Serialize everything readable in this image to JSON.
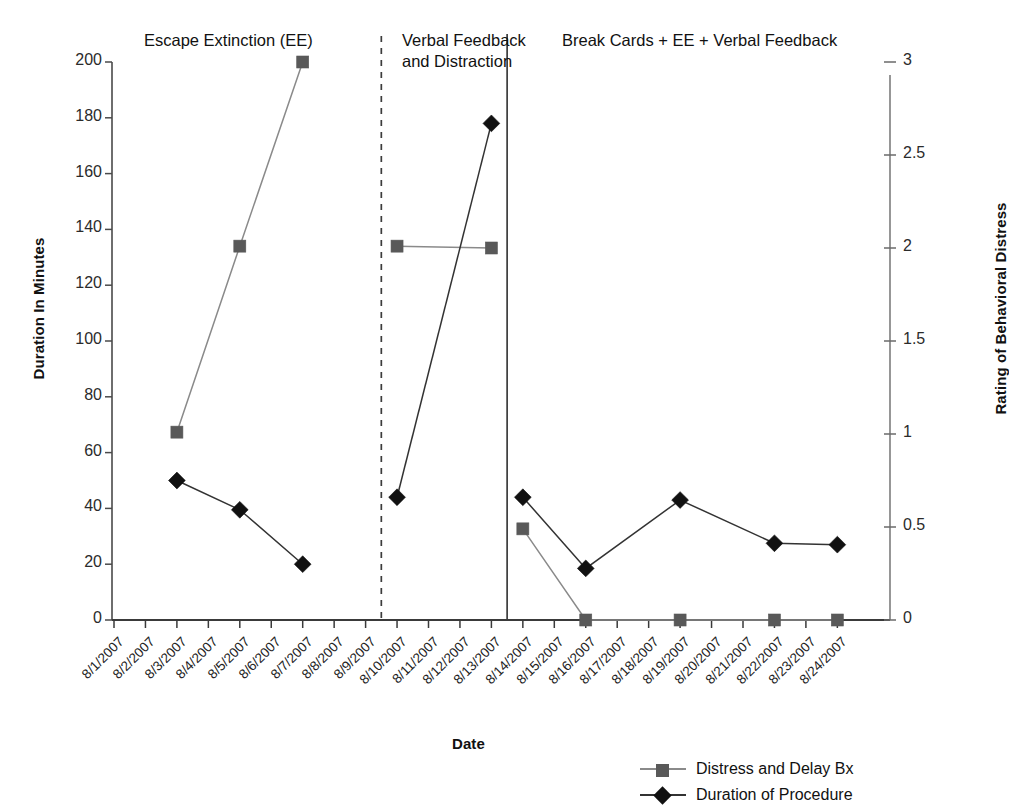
{
  "chart_data": {
    "type": "line",
    "title": "",
    "xlabel": "Date",
    "ylabel": "Duration In Minutes",
    "y2label": "Rating of Behavioral Distress",
    "ylim": [
      0,
      200
    ],
    "y2lim": [
      0,
      3
    ],
    "grid": false,
    "legend_position": "bottom-right",
    "x": [
      "8/1/2007",
      "8/2/2007",
      "8/3/2007",
      "8/4/2007",
      "8/5/2007",
      "8/6/2007",
      "8/7/2007",
      "8/8/2007",
      "8/9/2007",
      "8/10/2007",
      "8/11/2007",
      "8/12/2007",
      "8/13/2007",
      "8/14/2007",
      "8/15/2007",
      "8/16/2007",
      "8/17/2007",
      "8/18/2007",
      "8/19/2007",
      "8/20/2007",
      "8/21/2007",
      "8/22/2007",
      "8/23/2007",
      "8/24/2007"
    ],
    "y_ticks": [
      0,
      20,
      40,
      60,
      80,
      100,
      120,
      140,
      160,
      180,
      200
    ],
    "y2_ticks": [
      0,
      0.5,
      1,
      1.5,
      2,
      2.5,
      3
    ],
    "series": [
      {
        "name": "Distress and Delay Bx",
        "axis": "right",
        "marker": "square",
        "color": "#595959",
        "line_color": "#8a8a8a",
        "segments": [
          [
            {
              "x": "8/3/2007",
              "y_left": 67.5,
              "y_right": 1.01
            },
            {
              "x": "8/5/2007",
              "y_left": 134.0,
              "y_right": 2.01
            },
            {
              "x": "8/7/2007",
              "y_left": 200.0,
              "y_right": 3.0
            }
          ],
          [
            {
              "x": "8/10/2007",
              "y_left": 134.0,
              "y_right": 2.01
            },
            {
              "x": "8/13/2007",
              "y_left": 133.5,
              "y_right": 2.0
            }
          ],
          [
            {
              "x": "8/14/2007",
              "y_left": 33.0,
              "y_right": 0.49
            },
            {
              "x": "8/16/2007",
              "y_left": 0.0,
              "y_right": 0.0
            },
            {
              "x": "8/19/2007",
              "y_left": 0.0,
              "y_right": 0.0
            },
            {
              "x": "8/22/2007",
              "y_left": 0.0,
              "y_right": 0.0
            },
            {
              "x": "8/24/2007",
              "y_left": 0.0,
              "y_right": 0.0
            }
          ]
        ]
      },
      {
        "name": "Duration of Procedure",
        "axis": "left",
        "marker": "diamond",
        "color": "#111111",
        "line_color": "#333333",
        "segments": [
          [
            {
              "x": "8/3/2007",
              "y_left": 50.0
            },
            {
              "x": "8/5/2007",
              "y_left": 39.5
            },
            {
              "x": "8/7/2007",
              "y_left": 20.0
            }
          ],
          [
            {
              "x": "8/10/2007",
              "y_left": 44.0
            },
            {
              "x": "8/13/2007",
              "y_left": 178.0
            }
          ],
          [
            {
              "x": "8/14/2007",
              "y_left": 44.0
            },
            {
              "x": "8/16/2007",
              "y_left": 18.5
            },
            {
              "x": "8/19/2007",
              "y_left": 43.0
            },
            {
              "x": "8/22/2007",
              "y_left": 27.5
            },
            {
              "x": "8/24/2007",
              "y_left": 27.0
            }
          ]
        ]
      }
    ],
    "phases": [
      {
        "label": "Escape Extinction (EE)",
        "start_x": "8/1/2007",
        "end_x": "8/9/2007"
      },
      {
        "label": "Verbal Feedback\nand Distraction",
        "start_x": "8/9/2007",
        "end_x": "8/13/2007"
      },
      {
        "label": "Break Cards + EE + Verbal Feedback",
        "start_x": "8/13/2007",
        "end_x": "8/24/2007"
      }
    ],
    "phase_dividers": [
      {
        "after_x": "8/9/2007",
        "style": "dashed"
      },
      {
        "after_x": "8/13/2007",
        "style": "solid"
      }
    ],
    "legend": [
      {
        "label": "Distress and Delay Bx",
        "marker": "square",
        "color": "#595959"
      },
      {
        "label": "Duration of Procedure",
        "marker": "diamond",
        "color": "#111111"
      }
    ]
  }
}
